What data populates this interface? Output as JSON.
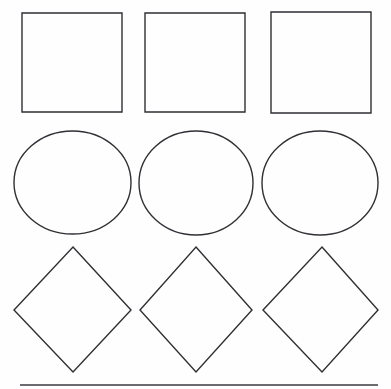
{
  "page": {
    "width": 391,
    "height": 389,
    "background_color": "#fefefe",
    "stroke_color": "#2f2f35",
    "stroke_width": 1.4,
    "fill": "none"
  },
  "grid": {
    "rows": 3,
    "columns": 3,
    "row_labels": [
      "squares",
      "circles",
      "diamonds"
    ]
  },
  "shapes": [
    {
      "id": "square-1",
      "kind": "square",
      "row": 1,
      "column": 1,
      "x": 22,
      "y": 13,
      "width": 100,
      "height": 99
    },
    {
      "id": "square-2",
      "kind": "square",
      "row": 1,
      "column": 2,
      "x": 145,
      "y": 13,
      "width": 100,
      "height": 99
    },
    {
      "id": "square-3",
      "kind": "square",
      "row": 1,
      "column": 3,
      "x": 271,
      "y": 12,
      "width": 100,
      "height": 101
    },
    {
      "id": "circle-1",
      "kind": "ellipse",
      "row": 2,
      "column": 1,
      "cx": 72.5,
      "cy": 182.5,
      "rx": 58.5,
      "ry": 51.5
    },
    {
      "id": "circle-2",
      "kind": "ellipse",
      "row": 2,
      "column": 2,
      "cx": 196,
      "cy": 183,
      "rx": 57,
      "ry": 52
    },
    {
      "id": "circle-3",
      "kind": "ellipse",
      "row": 2,
      "column": 3,
      "cx": 320,
      "cy": 183,
      "rx": 58,
      "ry": 52
    },
    {
      "id": "diamond-1",
      "kind": "diamond",
      "row": 3,
      "column": 1,
      "points": "73,247 131,310 73,372 14,310"
    },
    {
      "id": "diamond-2",
      "kind": "diamond",
      "row": 3,
      "column": 2,
      "points": "196,247 252,310 196,372 140,310"
    },
    {
      "id": "diamond-3",
      "kind": "diamond",
      "row": 3,
      "column": 3,
      "points": "322,247 378,310 322,372 263,310"
    }
  ],
  "rule": {
    "id": "bottom-rule",
    "x1": 20,
    "y1": 385,
    "x2": 378,
    "y2": 385,
    "color": "#3a3a40",
    "width": 1.6
  }
}
